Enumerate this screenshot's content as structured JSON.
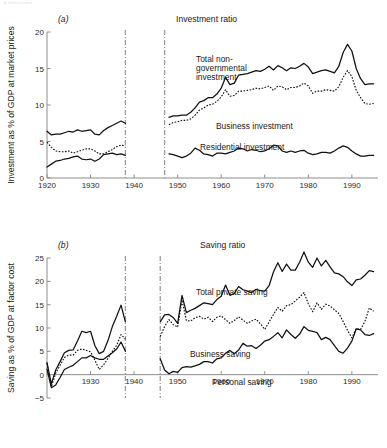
{
  "running_head": "6 Institutions",
  "panel_a": {
    "letter": "(a)",
    "title": "Investment ratio",
    "ylabel": "Investment as % of GDP at market prices",
    "labels": [
      {
        "text": "Total non-",
        "x": 196,
        "y": 62
      },
      {
        "text": "governmental",
        "x": 196,
        "y": 71
      },
      {
        "text": "investment",
        "x": 196,
        "y": 80
      },
      {
        "text": "Business investment",
        "x": 216,
        "y": 129
      },
      {
        "text": "Residential investment",
        "x": 200,
        "y": 150
      }
    ]
  },
  "panel_b": {
    "letter": "(b)",
    "title": "Saving ratio",
    "ylabel": "Saving as % of GDP at factor cost",
    "labels": [
      {
        "text": "Total private saving",
        "x": 196,
        "y": 295
      },
      {
        "text": "Business saving",
        "x": 190,
        "y": 357
      },
      {
        "text": "Personal saving",
        "x": 212,
        "y": 385
      }
    ]
  },
  "chart_data": [
    {
      "id": "investment-ratio",
      "type": "line",
      "title": "Investment ratio",
      "panel": "(a)",
      "xlabel": "",
      "ylabel": "Investment as % of GDP at market prices",
      "xlim": [
        1920,
        1996
      ],
      "ylim": [
        0,
        20
      ],
      "xticks": [
        1920,
        1930,
        1940,
        1950,
        1960,
        1970,
        1980,
        1990
      ],
      "yticks": [
        0,
        5,
        10,
        15,
        20
      ],
      "grid": false,
      "legend": "inline-annotations",
      "break_lines": [
        1938,
        1947
      ],
      "series": [
        {
          "name": "Total non-governmental investment",
          "style": "solid",
          "x": [
            1920,
            1921,
            1922,
            1923,
            1924,
            1925,
            1926,
            1927,
            1928,
            1929,
            1930,
            1931,
            1932,
            1933,
            1934,
            1935,
            1936,
            1937,
            1938
          ],
          "values": [
            6.4,
            5.9,
            6.0,
            6.0,
            6.2,
            6.4,
            6.3,
            6.6,
            6.4,
            6.5,
            6.6,
            6.0,
            5.9,
            6.5,
            6.9,
            7.2,
            7.5,
            7.8,
            7.5
          ],
          "x2": [
            1948,
            1949,
            1950,
            1951,
            1952,
            1953,
            1954,
            1955,
            1956,
            1957,
            1958,
            1959,
            1960,
            1961,
            1962,
            1963,
            1964,
            1965,
            1966,
            1967,
            1968,
            1969,
            1970,
            1971,
            1972,
            1973,
            1974,
            1975,
            1976,
            1977,
            1978,
            1979,
            1980,
            1981,
            1982,
            1983,
            1984,
            1985,
            1986,
            1987,
            1988,
            1989,
            1990,
            1991,
            1992,
            1993,
            1994,
            1995
          ],
          "values2": [
            8.3,
            8.5,
            8.5,
            8.6,
            8.6,
            9.0,
            9.6,
            10.4,
            10.6,
            11.0,
            11.0,
            11.5,
            12.3,
            13.8,
            12.8,
            13.0,
            14.1,
            14.2,
            14.3,
            14.5,
            14.7,
            14.6,
            14.9,
            15.3,
            14.8,
            15.4,
            15.1,
            14.7,
            15.1,
            15.0,
            15.3,
            15.7,
            15.2,
            14.3,
            14.5,
            14.7,
            14.8,
            14.6,
            14.4,
            15.3,
            17.2,
            18.3,
            17.4,
            15.0,
            13.6,
            12.8,
            12.9,
            12.9
          ]
        },
        {
          "name": "Business investment",
          "style": "dotted",
          "x": [
            1920,
            1921,
            1922,
            1923,
            1924,
            1925,
            1926,
            1927,
            1928,
            1929,
            1930,
            1931,
            1932,
            1933,
            1934,
            1935,
            1936,
            1937,
            1938
          ],
          "values": [
            4.9,
            4.2,
            3.7,
            3.6,
            3.6,
            3.7,
            3.4,
            3.6,
            3.8,
            4.0,
            4.0,
            3.7,
            3.3,
            3.3,
            3.6,
            3.9,
            4.3,
            4.5,
            4.4
          ],
          "x2": [
            1948,
            1949,
            1950,
            1951,
            1952,
            1953,
            1954,
            1955,
            1956,
            1957,
            1958,
            1959,
            1960,
            1961,
            1962,
            1963,
            1964,
            1965,
            1966,
            1967,
            1968,
            1969,
            1970,
            1971,
            1972,
            1973,
            1974,
            1975,
            1976,
            1977,
            1978,
            1979,
            1980,
            1981,
            1982,
            1983,
            1984,
            1985,
            1986,
            1987,
            1988,
            1989,
            1990,
            1991,
            1992,
            1993,
            1994,
            1995
          ],
          "values2": [
            7.3,
            7.6,
            7.7,
            7.9,
            7.9,
            8.1,
            8.6,
            9.3,
            9.6,
            10.0,
            10.1,
            10.5,
            11.1,
            12.1,
            11.2,
            11.3,
            11.9,
            11.9,
            12.0,
            12.1,
            12.3,
            12.2,
            12.4,
            12.6,
            12.0,
            12.6,
            12.5,
            12.1,
            12.4,
            12.4,
            12.6,
            13.0,
            12.6,
            11.6,
            11.9,
            11.9,
            12.1,
            12.0,
            11.9,
            12.5,
            13.8,
            14.7,
            13.9,
            12.0,
            11.0,
            10.2,
            10.1,
            10.2
          ]
        },
        {
          "name": "Residential investment",
          "style": "solid",
          "x": [
            1920,
            1921,
            1922,
            1923,
            1924,
            1925,
            1926,
            1927,
            1928,
            1929,
            1930,
            1931,
            1932,
            1933,
            1934,
            1935,
            1936,
            1937,
            1938
          ],
          "values": [
            1.5,
            1.9,
            2.3,
            2.4,
            2.6,
            2.7,
            2.9,
            3.0,
            2.6,
            2.5,
            2.6,
            2.3,
            2.6,
            3.2,
            3.3,
            3.4,
            3.2,
            3.3,
            3.1
          ],
          "x2": [
            1948,
            1949,
            1950,
            1951,
            1952,
            1953,
            1954,
            1955,
            1956,
            1957,
            1958,
            1959,
            1960,
            1961,
            1962,
            1963,
            1964,
            1965,
            1966,
            1967,
            1968,
            1969,
            1970,
            1971,
            1972,
            1973,
            1974,
            1975,
            1976,
            1977,
            1978,
            1979,
            1980,
            1981,
            1982,
            1983,
            1984,
            1985,
            1986,
            1987,
            1988,
            1989,
            1990,
            1991,
            1992,
            1993,
            1994,
            1995
          ],
          "values2": [
            3.3,
            3.2,
            3.0,
            2.8,
            3.0,
            3.4,
            4.1,
            3.8,
            3.3,
            3.2,
            3.0,
            3.4,
            3.4,
            3.3,
            3.5,
            3.7,
            4.1,
            4.0,
            3.7,
            3.9,
            3.8,
            3.6,
            3.7,
            4.0,
            4.5,
            4.4,
            3.7,
            3.5,
            3.7,
            3.5,
            3.7,
            3.8,
            3.4,
            3.2,
            3.3,
            3.5,
            3.5,
            3.4,
            3.7,
            4.1,
            4.4,
            4.2,
            3.7,
            3.3,
            3.0,
            3.0,
            3.1,
            3.1
          ]
        }
      ]
    },
    {
      "id": "saving-ratio",
      "type": "line",
      "title": "Saving ratio",
      "panel": "(b)",
      "xlabel": "",
      "ylabel": "Saving as % of GDP at factor cost",
      "xlim": [
        1920,
        1996
      ],
      "ylim": [
        -5,
        25
      ],
      "xticks": [
        1920,
        1930,
        1940,
        1950,
        1960,
        1970,
        1980,
        1990
      ],
      "xtick_labels": [
        "",
        "1930",
        "1940",
        "1950",
        "1960",
        "1970",
        "1980",
        "1990"
      ],
      "yticks": [
        -5,
        0,
        5,
        10,
        15,
        20,
        25
      ],
      "grid": false,
      "legend": "inline-annotations",
      "break_lines": [
        1938,
        1946
      ],
      "series": [
        {
          "name": "Total private saving",
          "style": "solid",
          "x": [
            1920,
            1921,
            1922,
            1923,
            1924,
            1925,
            1926,
            1927,
            1928,
            1929,
            1930,
            1931,
            1932,
            1933,
            1934,
            1935,
            1936,
            1937,
            1938
          ],
          "values": [
            2.6,
            -2.0,
            1.0,
            2.8,
            4.7,
            5.2,
            5.3,
            7.2,
            9.3,
            9.0,
            9.3,
            6.2,
            4.5,
            5.0,
            7.3,
            10.3,
            12.5,
            14.9,
            11.3
          ],
          "x2": [
            1946,
            1947,
            1948,
            1949,
            1950,
            1951,
            1952,
            1953,
            1954,
            1955,
            1956,
            1957,
            1958,
            1959,
            1960,
            1961,
            1962,
            1963,
            1964,
            1965,
            1966,
            1967,
            1968,
            1969,
            1970,
            1971,
            1972,
            1973,
            1974,
            1975,
            1976,
            1977,
            1978,
            1979,
            1980,
            1981,
            1982,
            1983,
            1984,
            1985,
            1986,
            1987,
            1988,
            1989,
            1990,
            1991,
            1992,
            1993,
            1994,
            1995
          ],
          "values2": [
            11.3,
            12.8,
            12.9,
            12.2,
            11.0,
            17.0,
            13.3,
            13.8,
            14.2,
            14.8,
            15.4,
            15.2,
            15.0,
            16.1,
            16.8,
            19.2,
            17.0,
            17.4,
            18.9,
            18.2,
            17.9,
            17.6,
            18.3,
            18.0,
            17.9,
            19.1,
            22.0,
            24.0,
            22.1,
            23.7,
            22.4,
            22.4,
            24.1,
            26.3,
            24.1,
            23.0,
            25.0,
            23.3,
            24.5,
            23.1,
            21.8,
            21.6,
            21.0,
            19.9,
            19.1,
            20.3,
            20.5,
            21.3,
            22.3,
            22.1
          ]
        },
        {
          "name": "Business saving",
          "style": "dotted",
          "x": [
            1920,
            1921,
            1922,
            1923,
            1924,
            1925,
            1926,
            1927,
            1928,
            1929,
            1930,
            1931,
            1932,
            1933,
            1934,
            1935,
            1936,
            1937,
            1938
          ],
          "values": [
            2.4,
            -2.6,
            0.3,
            2.0,
            3.7,
            4.2,
            4.2,
            5.2,
            5.5,
            5.2,
            4.9,
            3.1,
            1.1,
            2.1,
            3.5,
            5.0,
            6.3,
            8.6,
            7.6
          ],
          "x2": [
            1946,
            1947,
            1948,
            1949,
            1950,
            1951,
            1952,
            1953,
            1954,
            1955,
            1956,
            1957,
            1958,
            1959,
            1960,
            1961,
            1962,
            1963,
            1964,
            1965,
            1966,
            1967,
            1968,
            1969,
            1970,
            1971,
            1972,
            1973,
            1974,
            1975,
            1976,
            1977,
            1978,
            1979,
            1980,
            1981,
            1982,
            1983,
            1984,
            1985,
            1986,
            1987,
            1988,
            1989,
            1990,
            1991,
            1992,
            1993,
            1994,
            1995
          ],
          "values2": [
            8.2,
            10.3,
            11.8,
            10.7,
            10.2,
            16.0,
            11.6,
            11.5,
            12.2,
            12.5,
            11.9,
            12.3,
            11.4,
            12.3,
            12.6,
            11.8,
            11.0,
            11.6,
            12.4,
            11.7,
            11.0,
            11.5,
            11.9,
            10.9,
            9.7,
            11.3,
            12.9,
            14.4,
            13.6,
            14.8,
            15.0,
            15.8,
            16.6,
            17.6,
            15.2,
            13.5,
            15.4,
            14.0,
            15.1,
            14.7,
            13.9,
            13.1,
            11.4,
            9.5,
            7.9,
            9.9,
            9.7,
            11.4,
            14.3,
            13.6
          ]
        },
        {
          "name": "Personal saving",
          "style": "solid",
          "x": [
            1920,
            1921,
            1922,
            1923,
            1924,
            1925,
            1926,
            1927,
            1928,
            1929,
            1930,
            1931,
            1932,
            1933,
            1934,
            1935,
            1936,
            1937,
            1938
          ],
          "values": [
            1.2,
            -2.8,
            -2.2,
            -0.6,
            1.1,
            1.6,
            2.0,
            2.8,
            3.6,
            3.6,
            4.1,
            3.6,
            3.3,
            3.3,
            4.0,
            4.7,
            5.5,
            7.0,
            5.0
          ],
          "x2": [
            1946,
            1947,
            1948,
            1949,
            1950,
            1951,
            1952,
            1953,
            1954,
            1955,
            1956,
            1957,
            1958,
            1959,
            1960,
            1961,
            1962,
            1963,
            1964,
            1965,
            1966,
            1967,
            1968,
            1969,
            1970,
            1971,
            1972,
            1973,
            1974,
            1975,
            1976,
            1977,
            1978,
            1979,
            1980,
            1981,
            1982,
            1983,
            1984,
            1985,
            1986,
            1987,
            1988,
            1989,
            1990,
            1991,
            1992,
            1993,
            1994,
            1995
          ],
          "values2": [
            3.4,
            1.0,
            0.2,
            0.7,
            0.5,
            1.5,
            1.7,
            1.6,
            1.9,
            2.2,
            2.8,
            2.8,
            2.5,
            3.4,
            3.6,
            4.6,
            5.2,
            4.5,
            5.3,
            6.7,
            6.1,
            6.2,
            5.6,
            6.3,
            7.2,
            7.5,
            8.2,
            9.0,
            7.9,
            9.6,
            8.6,
            7.8,
            8.7,
            10.3,
            9.5,
            9.3,
            9.0,
            7.5,
            8.0,
            7.5,
            6.2,
            5.0,
            4.6,
            5.7,
            7.2,
            9.8,
            9.6,
            8.6,
            8.4,
            8.8
          ]
        }
      ]
    }
  ]
}
